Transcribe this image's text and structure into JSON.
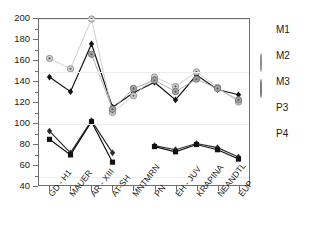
{
  "chart_data": {
    "type": "line",
    "title": "",
    "xlabel": "",
    "ylabel": "",
    "ylim": [
      40,
      200
    ],
    "ytick_labels": [
      "40",
      "60",
      "80",
      "100",
      "120",
      "140",
      "160",
      "180",
      "200"
    ],
    "ytick_values": [
      40,
      60,
      80,
      100,
      120,
      140,
      160,
      180,
      200
    ],
    "yminor_values": [
      50,
      70,
      90,
      110,
      130,
      150,
      170,
      190
    ],
    "gridlines": [
      50,
      100,
      150,
      200
    ],
    "grid": true,
    "legend_position": "right",
    "categories": [
      "GD - H1",
      "MAUER",
      "AR - XIII",
      "AT-SH",
      "MNTMRN",
      "PN",
      "EH - JUV",
      "KRAPINA",
      "NEANDTL",
      "EUP"
    ],
    "series": [
      {
        "name": "M1",
        "marker": "diamond-black",
        "color": "#111111",
        "values": [
          144,
          130,
          176,
          115,
          129,
          139,
          122,
          146,
          132,
          127
        ]
      },
      {
        "name": "M2",
        "marker": "circle-light",
        "color": "#c9c9c9",
        "values": [
          162,
          152,
          200,
          110,
          126,
          144,
          135,
          149,
          134,
          120
        ]
      },
      {
        "name": "M3",
        "marker": "circle-gray",
        "color": "#a8a8a8",
        "values": [
          null,
          null,
          166,
          113,
          133,
          141,
          130,
          142,
          133,
          122
        ]
      },
      {
        "name": "P3",
        "marker": "diamond-dark",
        "color": "#2b2b2b",
        "values": [
          92,
          71,
          102,
          71,
          null,
          78,
          74,
          80,
          76,
          67
        ]
      },
      {
        "name": "P4",
        "marker": "square-black",
        "color": "#111111",
        "values": [
          84,
          69,
          101,
          62,
          null,
          77,
          72,
          79,
          74,
          65
        ]
      }
    ]
  },
  "legend": {
    "items": [
      {
        "label": "M1"
      },
      {
        "label": "M2"
      },
      {
        "label": "M3"
      },
      {
        "label": "P3"
      },
      {
        "label": "P4"
      }
    ]
  }
}
